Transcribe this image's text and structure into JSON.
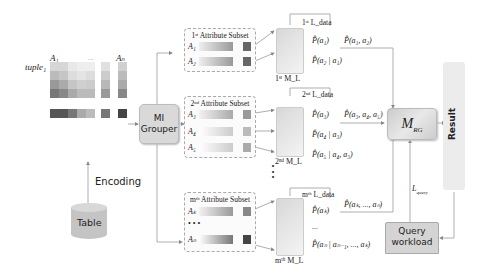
{
  "table": {
    "label": "Table"
  },
  "encoding": {
    "label": "Encoding"
  },
  "matrix": {
    "col_first": "A₁",
    "col_last": "Aₙ",
    "row_label": "tuple₁",
    "ellipsis": "..."
  },
  "grouper": {
    "label_line1": "MI",
    "label_line2": "Grouper"
  },
  "subsets": [
    {
      "title": "1ˢᵗ Attribute Subset",
      "attrs": [
        "A₁",
        "A₂"
      ],
      "model": "1ˢᵗ M_L",
      "ldata": "1ˢᵗ L_data",
      "probs": [
        "P̂(a₁)",
        "P̂(a₂ | a₁)"
      ],
      "joint": "P̂(a₁, a₂)"
    },
    {
      "title": "2ⁿᵈ Attribute Subset",
      "attrs": [
        "A₃",
        "A₄",
        "A₅"
      ],
      "model": "2ⁿᵈ M_L",
      "ldata": "2ⁿᵈ L_data",
      "probs": [
        "P̂(a₃)",
        "P̂(a₄ | a₃)",
        "P̂(a₅ | a₄, a₃)"
      ],
      "joint": "P̂(a₃, a₄, a₅)"
    },
    {
      "title": "mᵗʰ Attribute Subset",
      "attrs": [
        "Aₖ",
        "Aₙ"
      ],
      "model": "mᵗʰ M_L",
      "ldata": "mᵗʰ L_data",
      "probs": [
        "P̂(aₖ)",
        "...",
        "P̂(aₙ | aₙ₋₁, ..., aₖ)"
      ],
      "joint": "P̂(aₖ, ..., aₙ)"
    }
  ],
  "vertical_ellipsis": "⋮",
  "mrg": {
    "label": "M",
    "sub": "RG"
  },
  "result": {
    "label": "Result"
  },
  "query": {
    "line1": "Query",
    "line2": "workload"
  },
  "lquery": {
    "label": "L",
    "sub": "query"
  },
  "colors": {
    "grouper_bg": "#d9d9d9",
    "model_bg": "#e2e2e2",
    "arrow": "#888888",
    "result_bg": "#ececec"
  }
}
